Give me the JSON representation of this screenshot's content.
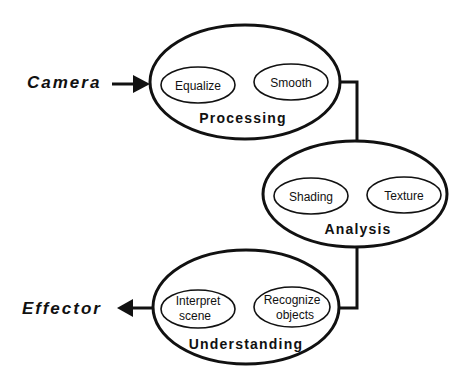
{
  "diagram": {
    "input": {
      "label": "Camera"
    },
    "output": {
      "label": "Effector"
    },
    "stages": [
      {
        "label": "Processing",
        "modules": [
          {
            "label": "Equalize"
          },
          {
            "label": "Smooth"
          }
        ]
      },
      {
        "label": "Analysis",
        "modules": [
          {
            "label": "Shading"
          },
          {
            "label": "Texture"
          }
        ]
      },
      {
        "label": "Understanding",
        "modules": [
          {
            "label_line1": "Interpret",
            "label_line2": "scene"
          },
          {
            "label_line1": "Recognize",
            "label_line2": "objects"
          }
        ]
      }
    ],
    "colors": {
      "stroke": "#111111",
      "background": "#ffffff"
    }
  }
}
